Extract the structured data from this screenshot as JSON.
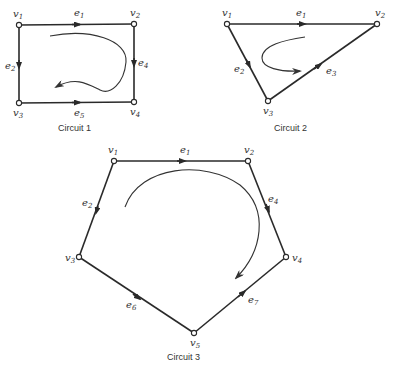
{
  "figure": {
    "colors": {
      "line": "#2a2a2a",
      "text": "#333333",
      "background": "#ffffff"
    },
    "circuits": [
      {
        "caption": "Circuit 1",
        "vertices": [
          {
            "name": "v",
            "sub": "1",
            "x": 19,
            "y": 25
          },
          {
            "name": "v",
            "sub": "2",
            "x": 134,
            "y": 24
          },
          {
            "name": "v",
            "sub": "3",
            "x": 19,
            "y": 103
          },
          {
            "name": "v",
            "sub": "4",
            "x": 134,
            "y": 102
          }
        ],
        "edges": [
          {
            "name": "e",
            "sub": "1",
            "from": "v1",
            "to": "v2"
          },
          {
            "name": "e",
            "sub": "2",
            "from": "v1",
            "to": "v3"
          },
          {
            "name": "e",
            "sub": "4",
            "from": "v2",
            "to": "v4"
          },
          {
            "name": "e",
            "sub": "5",
            "from": "v3",
            "to": "v4"
          }
        ],
        "orientation": "clockwise"
      },
      {
        "caption": "Circuit 2",
        "vertices": [
          {
            "name": "v",
            "sub": "1",
            "x": 227,
            "y": 24
          },
          {
            "name": "v",
            "sub": "2",
            "x": 377,
            "y": 24
          },
          {
            "name": "v",
            "sub": "3",
            "x": 268,
            "y": 101
          }
        ],
        "edges": [
          {
            "name": "e",
            "sub": "1",
            "from": "v1",
            "to": "v2"
          },
          {
            "name": "e",
            "sub": "2",
            "from": "v1",
            "to": "v3"
          },
          {
            "name": "e",
            "sub": "3",
            "from": "v3",
            "to": "v2"
          }
        ],
        "orientation": "counterclockwise"
      },
      {
        "caption": "Circuit 3",
        "vertices": [
          {
            "name": "v",
            "sub": "1",
            "x": 114,
            "y": 161
          },
          {
            "name": "v",
            "sub": "2",
            "x": 248,
            "y": 161
          },
          {
            "name": "v",
            "sub": "3",
            "x": 79,
            "y": 257
          },
          {
            "name": "v",
            "sub": "4",
            "x": 286,
            "y": 257
          },
          {
            "name": "v",
            "sub": "5",
            "x": 194,
            "y": 333
          }
        ],
        "edges": [
          {
            "name": "e",
            "sub": "1",
            "from": "v1",
            "to": "v2"
          },
          {
            "name": "e",
            "sub": "2",
            "from": "v1",
            "to": "v3"
          },
          {
            "name": "e",
            "sub": "4",
            "from": "v2",
            "to": "v4"
          },
          {
            "name": "e",
            "sub": "6",
            "from": "v3",
            "to": "v5"
          },
          {
            "name": "e",
            "sub": "7",
            "from": "v5",
            "to": "v4"
          }
        ],
        "orientation": "clockwise"
      }
    ]
  },
  "labels": {
    "c1": {
      "caption": "Circuit 1",
      "v1": "1",
      "v2": "2",
      "v3": "3",
      "v4": "4",
      "e1": "1",
      "e2": "2",
      "e4": "4",
      "e5": "5"
    },
    "c2": {
      "caption": "Circuit 2",
      "v1": "1",
      "v2": "2",
      "v3": "3",
      "e1": "1",
      "e2": "2",
      "e3": "3"
    },
    "c3": {
      "caption": "Circuit 3",
      "v1": "1",
      "v2": "2",
      "v3": "3",
      "v4": "4",
      "v5": "5",
      "e1": "1",
      "e2": "2",
      "e4": "4",
      "e6": "6",
      "e7": "7"
    },
    "vertex_letter": "v",
    "edge_letter": "e"
  }
}
